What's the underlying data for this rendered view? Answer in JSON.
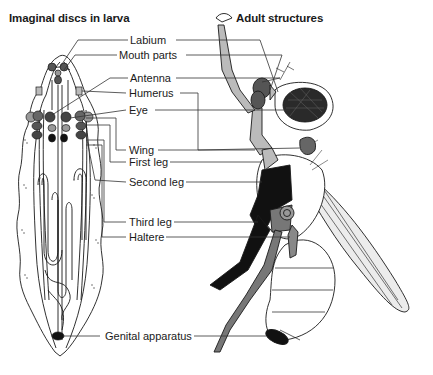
{
  "titles": {
    "larva": "Imaginal discs in larva",
    "adult": "Adult structures"
  },
  "labels": [
    {
      "id": "labium",
      "text": "Labium"
    },
    {
      "id": "mouth-parts",
      "text": "Mouth parts"
    },
    {
      "id": "antenna",
      "text": "Antenna"
    },
    {
      "id": "humerus",
      "text": "Humerus"
    },
    {
      "id": "eye",
      "text": "Eye"
    },
    {
      "id": "wing",
      "text": "Wing"
    },
    {
      "id": "first-leg",
      "text": "First leg"
    },
    {
      "id": "second-leg",
      "text": "Second leg"
    },
    {
      "id": "third-leg",
      "text": "Third leg"
    },
    {
      "id": "haltere",
      "text": "Haltere"
    },
    {
      "id": "genital-apparatus",
      "text": "Genital apparatus"
    }
  ],
  "colors": {
    "line": "#1a1a1a",
    "dark_gray": "#555555",
    "mid_gray": "#7a7a7a",
    "light_gray": "#b5b5b5",
    "black": "#111111",
    "wing_fill": "#ececec"
  }
}
